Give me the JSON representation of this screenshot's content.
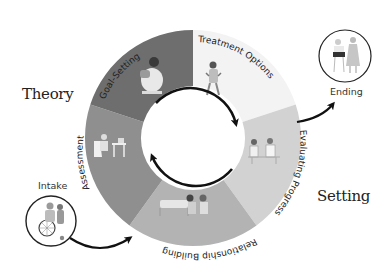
{
  "diagram": {
    "type": "cycle",
    "side_labels": {
      "left": "Theory",
      "right": "Setting"
    },
    "segments": [
      {
        "id": "treatment-options",
        "label": "Treatment Options",
        "color": "#f3f3f3",
        "start_deg": -90,
        "end_deg": -18
      },
      {
        "id": "evaluating-progress",
        "label": "Evaluating Progress",
        "color": "#d2d2d2",
        "start_deg": -18,
        "end_deg": 54
      },
      {
        "id": "relationship-building",
        "label": "Relationship Building",
        "color": "#b3b3b3",
        "start_deg": 54,
        "end_deg": 126
      },
      {
        "id": "assessment",
        "label": "Assessment",
        "color": "#8f8f8f",
        "start_deg": 126,
        "end_deg": 198
      },
      {
        "id": "goal-setting",
        "label": "Goal-Setting",
        "color": "#6e6e6e",
        "start_deg": 198,
        "end_deg": 270
      }
    ],
    "entry_node": {
      "label": "Intake",
      "icon": "wheelchair-person-icon"
    },
    "exit_node": {
      "label": "Ending",
      "icon": "two-people-standing-icon"
    },
    "center": {
      "arrows": "clockwise-cycle-icon"
    }
  }
}
